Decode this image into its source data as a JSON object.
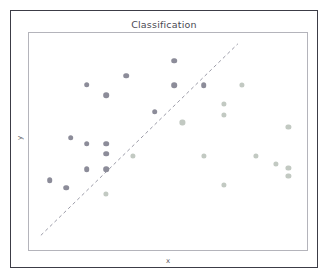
{
  "figure": {
    "title": "Classification",
    "xlabel": "x",
    "ylabel": "y",
    "background": "#ffffff",
    "outer_frame_color": "#3c3c46",
    "plot_frame_color": "#b4b4bb"
  },
  "chart_data": {
    "type": "scatter",
    "title": "Classification",
    "xlabel": "x",
    "ylabel": "y",
    "xlim": [
      0,
      1
    ],
    "ylim": [
      0,
      1
    ],
    "grid": false,
    "legend": null,
    "ticks": {
      "x": [],
      "y": []
    },
    "annotations": [
      {
        "name": "decision-boundary",
        "type": "line",
        "style": "dashed",
        "color": "#9a9aa6",
        "x0": 0.043,
        "y0": 0.059,
        "x1": 0.757,
        "y1": 0.95
      }
    ],
    "series": [
      {
        "name": "class-a",
        "color": "#8c8c99",
        "marker": "circle",
        "marker_size": 5.6,
        "points": [
          [
            0.522,
            0.872
          ],
          [
            0.35,
            0.803
          ],
          [
            0.207,
            0.762
          ],
          [
            0.277,
            0.713
          ],
          [
            0.522,
            0.76
          ],
          [
            0.629,
            0.76
          ],
          [
            0.452,
            0.638
          ],
          [
            0.15,
            0.517
          ],
          [
            0.207,
            0.49
          ],
          [
            0.277,
            0.49
          ],
          [
            0.277,
            0.443
          ],
          [
            0.207,
            0.373
          ],
          [
            0.277,
            0.373
          ],
          [
            0.075,
            0.322
          ],
          [
            0.134,
            0.288
          ]
        ]
      },
      {
        "name": "class-b",
        "color": "#c2c9c2",
        "marker": "circle",
        "marker_size": 5.2,
        "points": [
          [
            0.766,
            0.76
          ],
          [
            0.7,
            0.672
          ],
          [
            0.7,
            0.622
          ],
          [
            0.933,
            0.568
          ],
          [
            0.552,
            0.588
          ],
          [
            0.375,
            0.432
          ],
          [
            0.629,
            0.432
          ],
          [
            0.816,
            0.432
          ],
          [
            0.887,
            0.398
          ],
          [
            0.933,
            0.378
          ],
          [
            0.933,
            0.34
          ],
          [
            0.7,
            0.3
          ],
          [
            0.277,
            0.258
          ]
        ]
      }
    ]
  }
}
